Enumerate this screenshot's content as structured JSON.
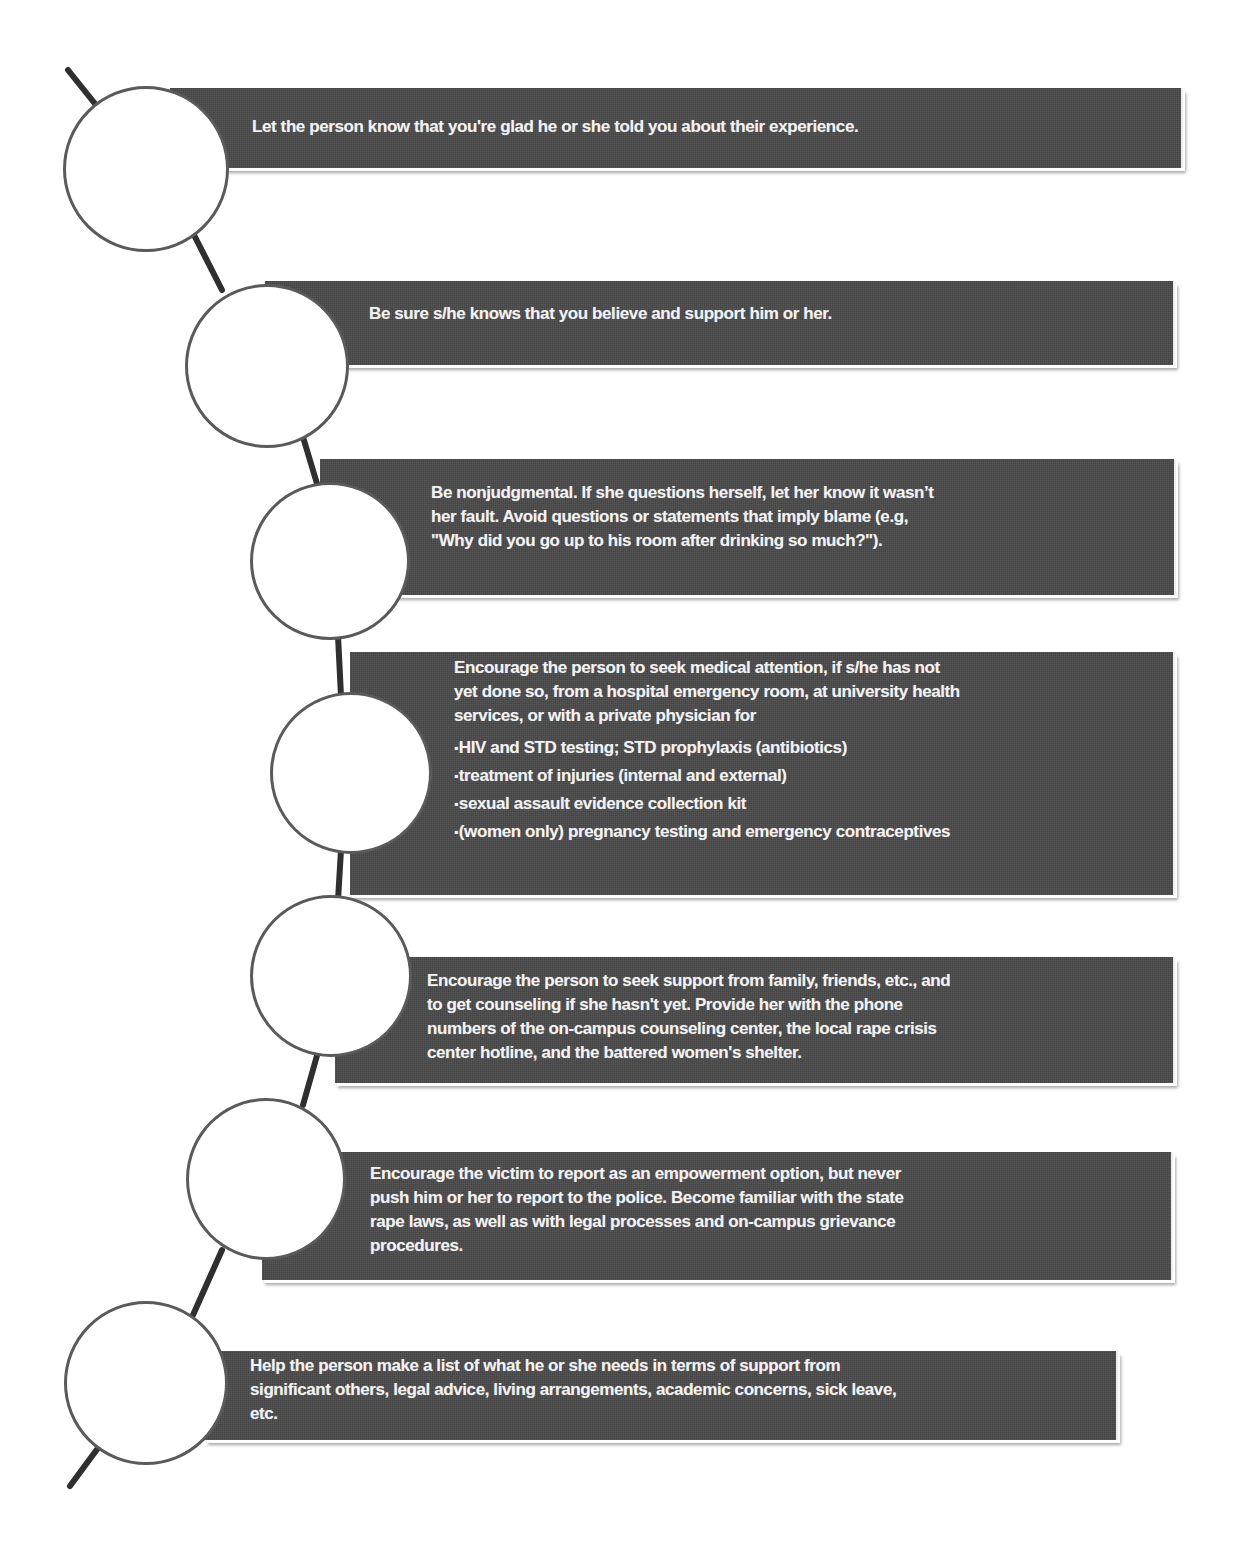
{
  "diagram": {
    "type": "vertical-timeline",
    "line_color": "#2f2f2f",
    "box_color": "#4a4a4a",
    "text_color": "#f2f2f2",
    "circle_fill": "#ffffff",
    "circle_border": "#5a5a5a"
  },
  "steps": [
    {
      "text": "Let the person know that you're glad he or she told you about their experience."
    },
    {
      "text": "Be sure s/he knows that you believe and support him or her."
    },
    {
      "lines": [
        "Be nonjudgmental.  If she questions herself, let her know it wasn’t",
        "her fault.  Avoid questions or statements that imply blame (e.g,",
        "\"Why did you go up to his room after drinking so much?\")."
      ]
    },
    {
      "lines": [
        "Encourage the person to seek medical attention, if  s/he has not",
        "yet done so, from a hospital emergency room, at university health",
        "services, or with a private physician for"
      ],
      "bullets": [
        "HIV and STD testing; STD prophylaxis (antibiotics)",
        "treatment of injuries (internal and external)",
        "sexual assault evidence collection kit",
        "(women only) pregnancy testing and emergency contraceptives"
      ]
    },
    {
      "lines": [
        "Encourage the person to seek support from family, friends, etc., and",
        "to get counseling if she hasn't yet.  Provide her with the phone",
        "numbers of the on-campus counseling center, the local rape crisis",
        "center hotline, and the battered women's shelter."
      ]
    },
    {
      "lines": [
        "Encourage the victim to report as an empowerment option, but never",
        "push him or her to report to the police.  Become familiar with the state",
        "rape laws, as well as with legal processes and on-campus grievance",
        "procedures."
      ]
    },
    {
      "lines": [
        "Help the person make a list of what he or she needs in terms of support from",
        "significant others, legal advice, living arrangements, academic concerns, sick leave,",
        "etc."
      ]
    }
  ]
}
